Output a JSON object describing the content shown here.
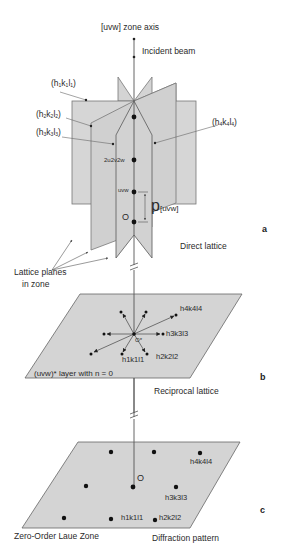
{
  "figure": {
    "panel_a": {
      "letter": "a",
      "caption": "Direct lattice",
      "zone_axis_label": "[uvw] zone axis",
      "incident_beam_label": "Incident beam",
      "plane_labels": [
        {
          "h": "h",
          "k": "k",
          "l": "l",
          "sub": "1"
        },
        {
          "h": "h",
          "k": "k",
          "l": "l",
          "sub": "2"
        },
        {
          "h": "h",
          "k": "k",
          "l": "l",
          "sub": "3"
        },
        {
          "h": "h",
          "k": "k",
          "l": "l",
          "sub": "4"
        }
      ],
      "plane_label_text": [
        "(h1k1l1)",
        "(h2k2l2)",
        "(h3k3l3)",
        "(h4k4l4)"
      ],
      "point_labels": {
        "p2": "2u2v2w",
        "p1": "uvw",
        "origin": "O"
      },
      "period_symbol": "p",
      "period_subscript": "[uvw]",
      "lattice_planes_label_line1": "Lattice planes",
      "lattice_planes_label_line2": "in zone"
    },
    "panel_b": {
      "letter": "b",
      "caption": "Reciprocal lattice",
      "layer_label": "(uvw)* layer with n = 0",
      "origin_label": "O*",
      "vector_labels": [
        "h4k4l4",
        "h3k3l3",
        "h2k2l2",
        "h1k1l1"
      ]
    },
    "panel_c": {
      "letter": "c",
      "caption": "Diffraction pattern",
      "zone_label": "Zero-Order Laue Zone",
      "origin_label": "O",
      "spot_labels": [
        "h4k4l4",
        "h3k3l3",
        "h2k2l2",
        "h1k1l1"
      ]
    },
    "colors": {
      "plane_fill": "#d4d4d4",
      "plane_stroke": "#777777",
      "line": "#555555",
      "dot": "#111111",
      "text": "#2a2a2a"
    }
  }
}
